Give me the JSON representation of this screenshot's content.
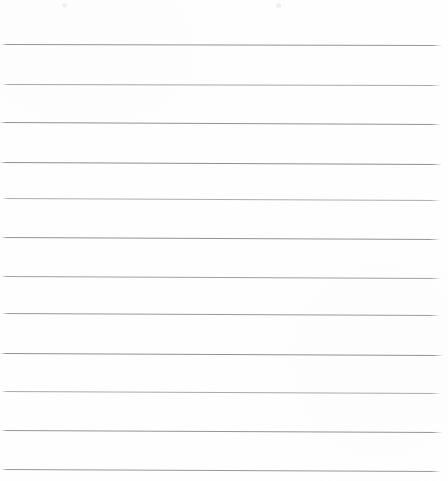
{
  "document": {
    "kind": "scanned-ruled-paper",
    "title": "Blank lined page",
    "page_width": 448,
    "page_height": 481,
    "background_color": "#fefefe",
    "has_text_content": false,
    "text_content": "",
    "rule_color": "#9a9a9a",
    "rule_count": 12,
    "left_margin": 0,
    "right_margin": 7
  },
  "rules": [
    {
      "index": 1,
      "y_left": 44,
      "y_right": 45,
      "x_start": 1,
      "x_end": 442,
      "color": "#8f8f8f",
      "thickness": 1.0,
      "opacity": 0.95
    },
    {
      "index": 2,
      "y_left": 84,
      "y_right": 85,
      "x_start": 2,
      "x_end": 441,
      "color": "#9b9b9b",
      "thickness": 1.0,
      "opacity": 0.88
    },
    {
      "index": 3,
      "y_left": 122,
      "y_right": 124,
      "x_start": 0,
      "x_end": 441,
      "color": "#8c8c8c",
      "thickness": 1.0,
      "opacity": 0.95
    },
    {
      "index": 4,
      "y_left": 162,
      "y_right": 164,
      "x_start": 0,
      "x_end": 442,
      "color": "#8a8a8a",
      "thickness": 1.0,
      "opacity": 0.96
    },
    {
      "index": 5,
      "y_left": 198,
      "y_right": 200,
      "x_start": 2,
      "x_end": 441,
      "color": "#9f9f9f",
      "thickness": 1.0,
      "opacity": 0.85
    },
    {
      "index": 6,
      "y_left": 237,
      "y_right": 239,
      "x_start": 1,
      "x_end": 440,
      "color": "#8d8d8d",
      "thickness": 1.0,
      "opacity": 0.94
    },
    {
      "index": 7,
      "y_left": 276,
      "y_right": 278,
      "x_start": 1,
      "x_end": 441,
      "color": "#969696",
      "thickness": 1.0,
      "opacity": 0.9
    },
    {
      "index": 8,
      "y_left": 313,
      "y_right": 315,
      "x_start": 2,
      "x_end": 440,
      "color": "#919191",
      "thickness": 1.0,
      "opacity": 0.92
    },
    {
      "index": 9,
      "y_left": 353,
      "y_right": 355,
      "x_start": 0,
      "x_end": 443,
      "color": "#8b8b8b",
      "thickness": 1.0,
      "opacity": 0.95
    },
    {
      "index": 10,
      "y_left": 391,
      "y_right": 393,
      "x_start": 1,
      "x_end": 441,
      "color": "#9d9d9d",
      "thickness": 1.0,
      "opacity": 0.86
    },
    {
      "index": 11,
      "y_left": 430,
      "y_right": 432,
      "x_start": 1,
      "x_end": 442,
      "color": "#8e8e8e",
      "thickness": 1.0,
      "opacity": 0.94
    },
    {
      "index": 12,
      "y_left": 469,
      "y_right": 471,
      "x_start": 1,
      "x_end": 441,
      "color": "#909090",
      "thickness": 1.0,
      "opacity": 0.93
    }
  ],
  "specks": [
    {
      "index": 1,
      "x": 62,
      "y": 3,
      "size": 5,
      "color": "#f3f3f3"
    },
    {
      "index": 2,
      "x": 276,
      "y": 3,
      "size": 5,
      "color": "#f1f1f1"
    }
  ]
}
